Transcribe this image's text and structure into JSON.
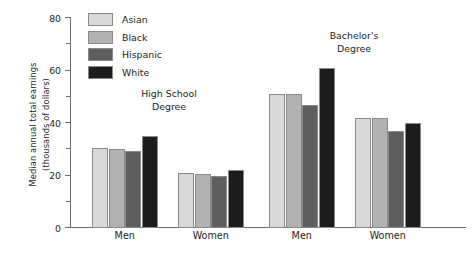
{
  "chart_data": {
    "type": "bar",
    "title": "",
    "xlabel": "",
    "ylabel": "Median annual total earnings (thousands of dollars)",
    "ylabel_lines": [
      "Median annual total earnings",
      "(thousands of dollars)"
    ],
    "ylim": [
      0,
      80
    ],
    "ytick_major": [
      "0",
      "20",
      "40",
      "60",
      "80"
    ],
    "ytick_major_values": [
      0,
      20,
      40,
      60,
      80
    ],
    "ytick_minor_values": [
      10,
      30,
      50,
      70
    ],
    "grid": false,
    "legend_position": "top-left-inside",
    "categories": [
      "Men",
      "Women",
      "Men",
      "Women"
    ],
    "group_annotations": [
      {
        "lines": [
          "High School",
          "Degree"
        ],
        "spans_categories": [
          0,
          1
        ]
      },
      {
        "lines": [
          "Bachelor's",
          "Degree"
        ],
        "spans_categories": [
          2,
          3
        ]
      }
    ],
    "series": [
      {
        "name": "Asian",
        "color": "#d9d9d9",
        "values": [
          30.5,
          21.0,
          51.0,
          42.0
        ]
      },
      {
        "name": "Black",
        "color": "#b2b2b2",
        "values": [
          30.0,
          20.5,
          51.0,
          42.0
        ]
      },
      {
        "name": "Hispanic",
        "color": "#5e5e5e",
        "values": [
          29.5,
          20.0,
          47.0,
          37.0
        ]
      },
      {
        "name": "White",
        "color": "#1c1c1c",
        "values": [
          35.0,
          22.0,
          61.0,
          40.0
        ]
      }
    ],
    "annotations": [
      {
        "text": "High School Degree"
      },
      {
        "text": "Bachelor's Degree"
      }
    ]
  },
  "legend": {
    "items": [
      {
        "label": "Asian"
      },
      {
        "label": "Black"
      },
      {
        "label": "Hispanic"
      },
      {
        "label": "White"
      }
    ]
  },
  "annotations": {
    "high_school": {
      "line1": "High School",
      "line2": "Degree"
    },
    "bachelors": {
      "line1": "Bachelor's",
      "line2": "Degree"
    }
  },
  "axis": {
    "y_title_line1": "Median annual total earnings",
    "y_title_line2": "(thousands of dollars)"
  }
}
